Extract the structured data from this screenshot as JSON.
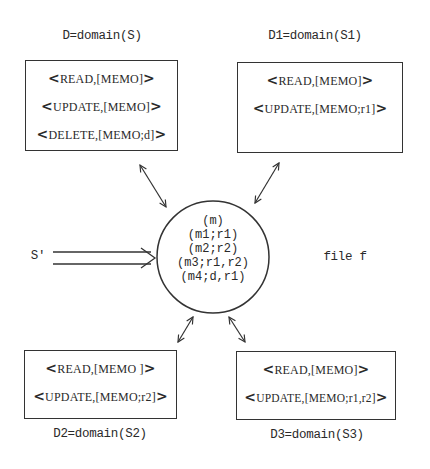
{
  "domains": [
    {
      "label": "D=domain(S)",
      "entries": [
        {
          "op": "READ",
          "args": "[MEMO]"
        },
        {
          "op": "UPDATE",
          "args": "[MEMO]"
        },
        {
          "op": "DELETE",
          "args": "[MEMO;d]"
        }
      ]
    },
    {
      "label": "D1=domain(S1)",
      "entries": [
        {
          "op": "READ",
          "args": "[MEMO]"
        },
        {
          "op": "UPDATE",
          "args": "[MEMO;r1]"
        }
      ]
    },
    {
      "label": "D2=domain(S2)",
      "entries": [
        {
          "op": "READ",
          "args": "[MEMO ]"
        },
        {
          "op": "UPDATE",
          "args": "[MEMO;r2]"
        }
      ]
    },
    {
      "label": "D3=domain(S3)",
      "entries": [
        {
          "op": "READ",
          "args": "[MEMO]"
        },
        {
          "op": "UPDATE",
          "args": "[MEMO;r1,r2]"
        }
      ]
    }
  ],
  "file": {
    "label": "file f",
    "records": [
      "(m)",
      "(m1;r1)",
      "(m2;r2)",
      "(m3;r1,r2)",
      "(m4;d,r1)"
    ]
  },
  "subject": {
    "label": "S'"
  },
  "symbols": {
    "open": "<",
    "close": ">",
    "sep": ","
  }
}
